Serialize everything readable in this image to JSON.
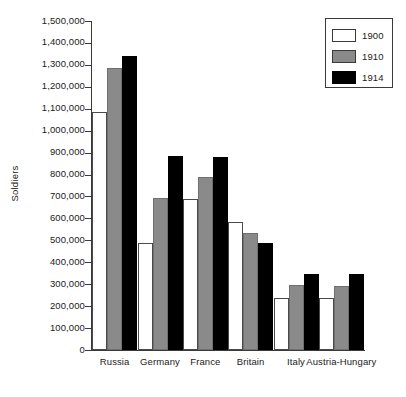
{
  "chart_data": {
    "type": "bar",
    "title": "",
    "xlabel": "",
    "ylabel": "Soldiers",
    "ylim": [
      0,
      1500000
    ],
    "ytick_step": 100000,
    "grid": false,
    "legend_position": "top-right",
    "categories": [
      "Russia",
      "Germany",
      "France",
      "Britain",
      "Italy",
      "Austria-Hungary"
    ],
    "ytick_labels": [
      "1,500,000",
      "1,400,000",
      "1,300,000",
      "1,200,000",
      "1,100,000",
      "1,000,000",
      "900,000",
      "800,000",
      "700,000",
      "600,000",
      "500,000",
      "400,000",
      "300,000",
      "200,000",
      "100,000",
      "0"
    ],
    "series": [
      {
        "name": "1900",
        "color": "#ffffff",
        "values": [
          1085000,
          490000,
          690000,
          585000,
          235000,
          235000
        ]
      },
      {
        "name": "1910",
        "color": "#8a8a8a",
        "values": [
          1285000,
          695000,
          790000,
          535000,
          295000,
          290000
        ]
      },
      {
        "name": "1914",
        "color": "#000000",
        "values": [
          1340000,
          885000,
          880000,
          490000,
          345000,
          345000
        ]
      }
    ]
  },
  "legend": {
    "items": [
      {
        "label": "1900"
      },
      {
        "label": "1910"
      },
      {
        "label": "1914"
      }
    ]
  }
}
